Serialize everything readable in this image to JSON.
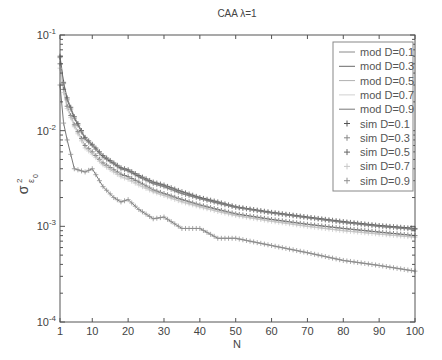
{
  "chart_data": {
    "type": "line",
    "title": "CAA   λ=1",
    "xlabel": "N",
    "ylabel": "σ²_ε₀",
    "xlim": [
      1,
      100
    ],
    "ylim": [
      0.0001,
      0.1
    ],
    "yscale": "log",
    "grid": false,
    "legend_position": "upper right",
    "x_ticks": [
      1,
      10,
      20,
      30,
      40,
      50,
      60,
      70,
      80,
      90,
      100
    ],
    "y_ticks": [
      "10^-4",
      "10^-3",
      "10^-2",
      "10^-1"
    ],
    "x": [
      1,
      2,
      3,
      5,
      8,
      10,
      13,
      16,
      18,
      20,
      23,
      27,
      30,
      35,
      40,
      45,
      50,
      60,
      70,
      80,
      90,
      100
    ],
    "series": [
      {
        "name": "mod D=0.1",
        "style": "line",
        "color": "#8a8a8a",
        "values": [
          0.06,
          0.032,
          0.022,
          0.014,
          0.0085,
          0.0072,
          0.0055,
          0.0046,
          0.0041,
          0.0039,
          0.0034,
          0.0029,
          0.0027,
          0.0023,
          0.002,
          0.0018,
          0.0016,
          0.0014,
          0.00125,
          0.00112,
          0.00102,
          0.00095
        ]
      },
      {
        "name": "mod D=0.3",
        "style": "line",
        "color": "#6a6a6a",
        "values": [
          0.058,
          0.031,
          0.021,
          0.0135,
          0.0082,
          0.007,
          0.0053,
          0.0045,
          0.004,
          0.0038,
          0.0033,
          0.0028,
          0.0026,
          0.0022,
          0.00195,
          0.00175,
          0.00158,
          0.00138,
          0.00123,
          0.0011,
          0.001,
          0.00093
        ]
      },
      {
        "name": "mod D=0.5",
        "style": "line",
        "color": "#b0b0b0",
        "values": [
          0.05,
          0.027,
          0.018,
          0.0115,
          0.007,
          0.006,
          0.0046,
          0.0039,
          0.0035,
          0.0033,
          0.0029,
          0.0024,
          0.0022,
          0.0019,
          0.00167,
          0.0015,
          0.00135,
          0.00118,
          0.00105,
          0.00095,
          0.00087,
          0.0008
        ]
      },
      {
        "name": "mod D=0.7",
        "style": "line",
        "color": "#d0d0d0",
        "values": [
          0.045,
          0.025,
          0.017,
          0.011,
          0.0066,
          0.0057,
          0.0044,
          0.0037,
          0.0033,
          0.0031,
          0.0027,
          0.0023,
          0.0021,
          0.0018,
          0.0016,
          0.00143,
          0.0013,
          0.00113,
          0.001,
          0.0009,
          0.00083,
          0.00077
        ]
      },
      {
        "name": "mod D=0.9",
        "style": "line",
        "color": "#777777",
        "values": [
          0.03,
          0.012,
          0.008,
          0.004,
          0.0037,
          0.004,
          0.0026,
          0.002,
          0.0018,
          0.0019,
          0.0015,
          0.0012,
          0.00125,
          0.00095,
          0.00095,
          0.00075,
          0.00075,
          0.00063,
          0.00053,
          0.00044,
          0.00039,
          0.00034
        ]
      },
      {
        "name": "sim D=0.1",
        "style": "marker",
        "color": "#555555",
        "values": [
          0.06,
          0.032,
          0.022,
          0.014,
          0.0085,
          0.0072,
          0.0055,
          0.0046,
          0.0041,
          0.0039,
          0.0034,
          0.0029,
          0.0027,
          0.0023,
          0.002,
          0.0018,
          0.0016,
          0.0014,
          0.00125,
          0.00112,
          0.00102,
          0.00095
        ]
      },
      {
        "name": "sim D=0.3",
        "style": "marker",
        "color": "#888888",
        "values": [
          0.058,
          0.031,
          0.021,
          0.0135,
          0.0082,
          0.007,
          0.0053,
          0.0045,
          0.004,
          0.0038,
          0.0033,
          0.0028,
          0.0026,
          0.0022,
          0.00195,
          0.00175,
          0.00158,
          0.00138,
          0.00123,
          0.0011,
          0.001,
          0.00093
        ]
      },
      {
        "name": "sim D=0.5",
        "style": "marker",
        "color": "#666666",
        "values": [
          0.05,
          0.027,
          0.018,
          0.0115,
          0.007,
          0.006,
          0.0046,
          0.0039,
          0.0035,
          0.0033,
          0.0029,
          0.0024,
          0.0022,
          0.0019,
          0.00167,
          0.0015,
          0.00135,
          0.00118,
          0.00105,
          0.00095,
          0.00087,
          0.0008
        ]
      },
      {
        "name": "sim D=0.7",
        "style": "marker",
        "color": "#c8c8c8",
        "values": [
          0.045,
          0.025,
          0.017,
          0.011,
          0.0066,
          0.0057,
          0.0044,
          0.0037,
          0.0033,
          0.0031,
          0.0027,
          0.0023,
          0.0021,
          0.0018,
          0.0016,
          0.00143,
          0.0013,
          0.00113,
          0.001,
          0.0009,
          0.00083,
          0.00077
        ]
      },
      {
        "name": "sim D=0.9",
        "style": "marker",
        "color": "#909090",
        "values": [
          0.03,
          0.012,
          0.008,
          0.004,
          0.0037,
          0.004,
          0.0026,
          0.002,
          0.0018,
          0.0019,
          0.0015,
          0.0012,
          0.00125,
          0.00095,
          0.00095,
          0.00075,
          0.00075,
          0.00063,
          0.00053,
          0.00044,
          0.00039,
          0.00034
        ]
      }
    ]
  }
}
